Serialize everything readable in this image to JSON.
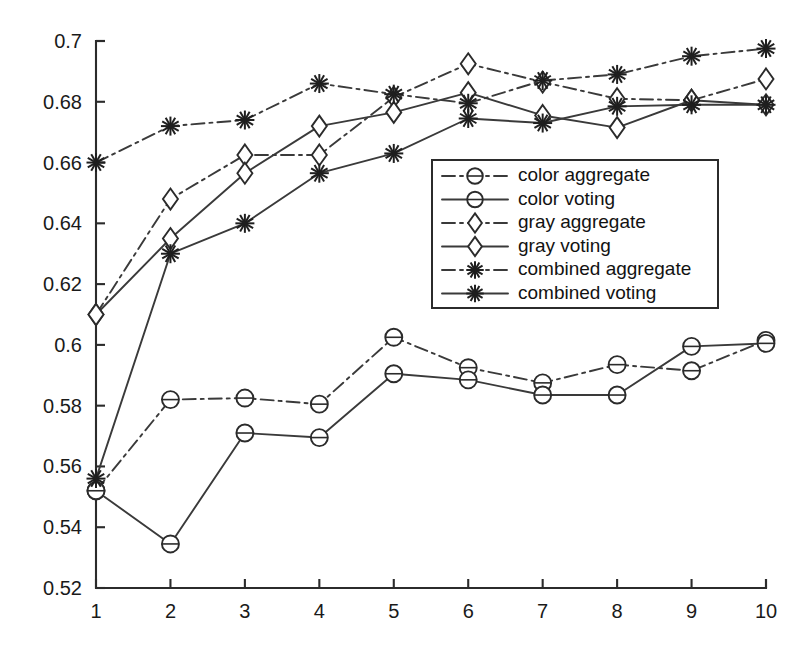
{
  "chart_data": {
    "type": "line",
    "title": "",
    "xlabel": "",
    "ylabel": "",
    "x": [
      1,
      2,
      3,
      4,
      5,
      6,
      7,
      8,
      9,
      10
    ],
    "xtick_labels": [
      "1",
      "2",
      "3",
      "4",
      "5",
      "6",
      "7",
      "8",
      "9",
      "10"
    ],
    "ytick_labels": [
      "0.52",
      "0.54",
      "0.56",
      "0.58",
      "0.6",
      "0.62",
      "0.64",
      "0.66",
      "0.68",
      "0.7"
    ],
    "ytick_values": [
      0.52,
      0.54,
      0.56,
      0.58,
      0.6,
      0.62,
      0.64,
      0.66,
      0.68,
      0.7
    ],
    "xlim": [
      1,
      10
    ],
    "ylim": [
      0.52,
      0.7
    ],
    "grid": false,
    "legend_position": "center",
    "series": [
      {
        "name": "color aggregate",
        "marker": "circle",
        "linestyle": "dashdot",
        "values": [
          0.552,
          0.582,
          0.5825,
          0.5805,
          0.6025,
          0.5925,
          0.5875,
          0.5935,
          0.5915,
          0.6015
        ]
      },
      {
        "name": "color voting",
        "marker": "circle",
        "linestyle": "solid",
        "values": [
          0.552,
          0.5345,
          0.571,
          0.5695,
          0.5905,
          0.5885,
          0.5835,
          0.5835,
          0.5995,
          0.6005
        ]
      },
      {
        "name": "gray aggregate",
        "marker": "diamond",
        "linestyle": "dashdot",
        "values": [
          0.61,
          0.648,
          0.6625,
          0.6625,
          0.6815,
          0.6925,
          0.6865,
          0.681,
          0.6805,
          0.6875
        ]
      },
      {
        "name": "gray voting",
        "marker": "diamond",
        "linestyle": "solid",
        "values": [
          0.61,
          0.635,
          0.6565,
          0.672,
          0.6765,
          0.683,
          0.6755,
          0.6715,
          0.6805,
          0.679
        ]
      },
      {
        "name": "combined aggregate",
        "marker": "star",
        "linestyle": "dashdot",
        "values": [
          0.66,
          0.672,
          0.674,
          0.686,
          0.6825,
          0.6795,
          0.687,
          0.689,
          0.695,
          0.6975
        ]
      },
      {
        "name": "combined voting",
        "marker": "star",
        "linestyle": "solid",
        "values": [
          0.556,
          0.63,
          0.64,
          0.6565,
          0.663,
          0.6745,
          0.673,
          0.6785,
          0.679,
          0.679
        ]
      }
    ],
    "legend_entries": [
      {
        "label": "color aggregate",
        "marker": "circle",
        "linestyle": "dashdot"
      },
      {
        "label": "color voting",
        "marker": "circle",
        "linestyle": "solid"
      },
      {
        "label": "gray aggregate",
        "marker": "diamond",
        "linestyle": "dashdot"
      },
      {
        "label": "gray voting",
        "marker": "diamond",
        "linestyle": "solid"
      },
      {
        "label": "combined aggregate",
        "marker": "star",
        "linestyle": "dashdot"
      },
      {
        "label": "combined voting",
        "marker": "star",
        "linestyle": "solid"
      }
    ],
    "colors": {
      "line": "#3a3a3a",
      "axis": "#2b2b2b",
      "text": "#1a1a1a",
      "background": "#ffffff"
    }
  }
}
